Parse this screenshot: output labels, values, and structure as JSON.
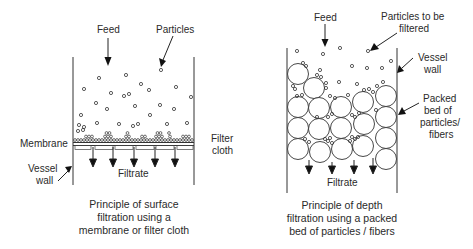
{
  "left_panel": {
    "labels": {
      "feed": "Feed",
      "particles": "Particles",
      "membrane": "Membrane",
      "filter_cloth_1": "Filter",
      "filter_cloth_2": "cloth",
      "vessel_wall_1": "Vessel",
      "vessel_wall_2": "wall",
      "filtrate": "Filtrate"
    },
    "caption": [
      "Principle of surface",
      "filtration using a",
      "membrane or filter cloth"
    ]
  },
  "right_panel": {
    "labels": {
      "feed": "Feed",
      "particles_1": "Particles to be",
      "particles_2": "filtered",
      "vessel_wall_1": "Vessel",
      "vessel_wall_2": "wall",
      "packed_1": "Packed",
      "packed_2": "bed of",
      "packed_3": "particles/",
      "packed_4": "fibers",
      "filtrate": "Filtrate"
    },
    "caption": [
      "Principle of depth",
      "filtration using a packed",
      "bed of particles / fibers"
    ]
  }
}
